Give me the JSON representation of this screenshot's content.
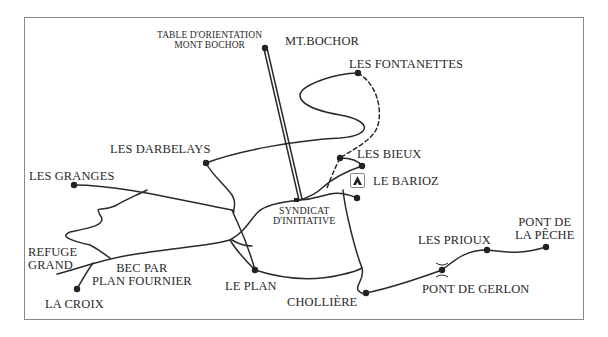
{
  "map": {
    "title": "Trail map around Mont Bochor",
    "colors": {
      "ink": "#2a2a2a",
      "frame": "#8a8a8a",
      "background": "#ffffff"
    },
    "labels": {
      "table_orientation_line1": "TABLE D'ORIENTATION",
      "table_orientation_line2": "MONT BOCHOR",
      "mt_bochor": "MT.BOCHOR",
      "les_fontanettes": "LES FONTANETTES",
      "les_darbelays": "LES DARBELAYS",
      "les_bieux": "LES BIEUX",
      "le_barioz": "LE BARIOZ",
      "les_granges": "LES GRANGES",
      "syndicat_line1": "SYNDICAT",
      "syndicat_line2": "D'INITIATIVE",
      "refuge_line1": "REFUGE",
      "refuge_line2": "GRAND",
      "bec_line1": "BEC PAR",
      "bec_line2": "PLAN FOURNIER",
      "la_croix": "LA CROIX",
      "le_plan": "LE PLAN",
      "chollière": "CHOLLIÈRE",
      "les_prioux": "LES PRIOUX",
      "pont_peche_line1": "PONT DE",
      "pont_peche_line2": "LA PÊCHE",
      "pont_gerlon": "PONT DE GERLON"
    },
    "legend_icons": {
      "refuge_hut": "hut-icon",
      "bridge": "bridge-icon",
      "cable_car": "cable-car-line",
      "waypoint": "waypoint-dot"
    }
  }
}
